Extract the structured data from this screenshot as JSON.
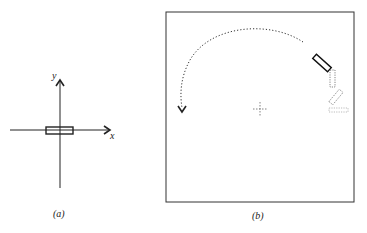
{
  "panels": [
    {
      "id": "a",
      "caption": "(a)",
      "axes": {
        "x_label": "x",
        "y_label": "y"
      },
      "object": "rectangle centered at origin, aligned with x-axis"
    },
    {
      "id": "b",
      "caption": "(b)",
      "elements": [
        "frame",
        "solid rectangle tilted ~40deg (current pose)",
        "dashed ghost rectangles (previous poses)",
        "dotted curved trajectory arrow (counter-clockwise arc)",
        "crosshair center marker"
      ]
    }
  ],
  "colors": {
    "ink": "#222222",
    "ghost": "#888888",
    "background": "#ffffff"
  }
}
